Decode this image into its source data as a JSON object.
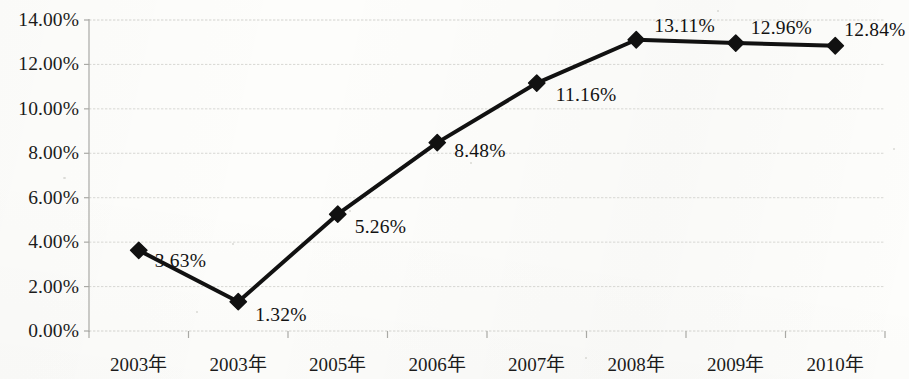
{
  "chart_data": {
    "type": "line",
    "title": "",
    "subtitle": "",
    "xlabel": "",
    "ylabel": "",
    "categories": [
      "2003年",
      "2003年",
      "2005年",
      "2006年",
      "2007年",
      "2008年",
      "2009年",
      "2010年"
    ],
    "values": [
      3.63,
      1.32,
      5.26,
      8.48,
      11.16,
      13.11,
      12.96,
      12.84
    ],
    "point_labels": [
      "3.63%",
      "1.32%",
      "5.26%",
      "8.48%",
      "11.16%",
      "13.11%",
      "12.96%",
      "12.84%"
    ],
    "series": [
      {
        "name": "",
        "values": [
          3.63,
          1.32,
          5.26,
          8.48,
          11.16,
          13.11,
          12.96,
          12.84
        ],
        "marker": "diamond",
        "color": "#111111",
        "line_width": 4
      }
    ],
    "ylim": [
      0,
      14
    ],
    "ytick_values": [
      0,
      2,
      4,
      6,
      8,
      10,
      12,
      14
    ],
    "ytick_labels": [
      "0.00%",
      "2.00%",
      "4.00%",
      "6.00%",
      "8.00%",
      "10.00%",
      "12.00%",
      "14.00%"
    ],
    "grid": true,
    "grid_axis": "y",
    "grid_color": "#d0d0cc",
    "legend": false,
    "legend_position": "none",
    "data_labels": true,
    "axis_line_color": "#a9a9a5",
    "background_color": "#fdfdfb"
  },
  "layout": {
    "plot_left": 89,
    "plot_right": 885,
    "plot_top": 20,
    "plot_bottom": 331,
    "category_count": 8
  }
}
